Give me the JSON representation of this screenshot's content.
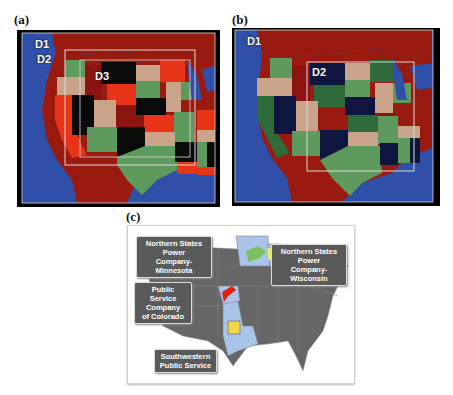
{
  "panels": {
    "a": {
      "label": "(a)",
      "domains": [
        {
          "id": "D1",
          "label": "D1"
        },
        {
          "id": "D2",
          "label": "D2"
        },
        {
          "id": "D3",
          "label": "D3"
        }
      ]
    },
    "b": {
      "label": "(b)",
      "domains": [
        {
          "id": "D1",
          "label": "D1"
        },
        {
          "id": "D2",
          "label": "D2"
        }
      ]
    },
    "c": {
      "label": "(c)",
      "callouts": [
        {
          "id": "nsp-mn",
          "line1": "Northern States Power",
          "line2": "Company- Minnesota"
        },
        {
          "id": "nsp-wi",
          "line1": "Northern States Power",
          "line2": "Company- Wisconsin"
        },
        {
          "id": "psco",
          "line1": "Public Service",
          "line2": "Company",
          "line3": "of Colorado"
        },
        {
          "id": "sps",
          "line1": "Southwestern",
          "line2": "Public Service"
        }
      ]
    }
  },
  "colors": {
    "ocean": "#2f4fa8",
    "land_outside": "#9a1a10",
    "state_red": "#e83418",
    "state_dark_red": "#8c1410",
    "state_tan": "#c9a48a",
    "state_green": "#5e9a5e",
    "state_black": "#0a0a0a",
    "state_navy": "#0e1640",
    "state_dark_green": "#2f6a3a",
    "box_outline": "#d8d8d8",
    "map_gray": "#666666",
    "service_blue": "#a9c4e8",
    "service_red": "#e02010",
    "service_yellow": "#f2d44a",
    "service_green": "#7ac060",
    "service_lime": "#e8ef6a"
  }
}
